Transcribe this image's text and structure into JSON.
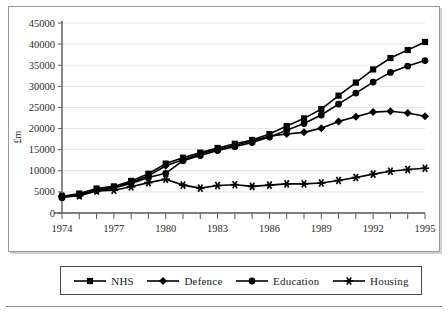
{
  "chart_data": {
    "type": "line",
    "title": "",
    "subtitle": "",
    "xlabel": "",
    "ylabel": "£m",
    "x": [
      1974,
      1975,
      1976,
      1977,
      1978,
      1979,
      1980,
      1981,
      1982,
      1983,
      1984,
      1985,
      1986,
      1987,
      1988,
      1989,
      1990,
      1991,
      1992,
      1993,
      1994,
      1995
    ],
    "xlim": [
      1974,
      1995
    ],
    "ylim": [
      0,
      45000
    ],
    "ytick_labels": [
      "0",
      "5000",
      "10000",
      "15000",
      "20000",
      "25000",
      "30000",
      "35000",
      "40000",
      "45000"
    ],
    "ytick_values": [
      0,
      5000,
      10000,
      15000,
      20000,
      25000,
      30000,
      35000,
      40000,
      45000
    ],
    "xtick_labels": [
      "1974",
      "1977",
      "1980",
      "1983",
      "1986",
      "1989",
      "1992",
      "1995"
    ],
    "xtick_values": [
      1974,
      1977,
      1980,
      1983,
      1986,
      1989,
      1992,
      1995
    ],
    "grid": true,
    "grid_axis": "y",
    "legend_position": "bottom",
    "series": [
      {
        "name": "NHS",
        "marker": "square",
        "color": "#000000",
        "values": [
          3900,
          4600,
          5800,
          6300,
          7600,
          9300,
          11700,
          13100,
          14300,
          15400,
          16400,
          17300,
          18700,
          20600,
          22400,
          24600,
          27800,
          30900,
          34000,
          36700,
          38600,
          40500
        ]
      },
      {
        "name": "Defence",
        "marker": "diamond",
        "color": "#000000",
        "values": [
          3800,
          4400,
          5500,
          6100,
          7200,
          8800,
          11200,
          12600,
          14000,
          15100,
          16000,
          17100,
          18200,
          18700,
          19100,
          20100,
          21700,
          22800,
          23900,
          24100,
          23700,
          22900
        ]
      },
      {
        "name": "Education",
        "marker": "circle",
        "color": "#000000",
        "values": [
          3600,
          4200,
          5300,
          5900,
          7000,
          8400,
          9400,
          12400,
          13600,
          14800,
          15700,
          16700,
          18000,
          19600,
          21200,
          23200,
          25800,
          28400,
          31000,
          33300,
          34800,
          36100
        ]
      },
      {
        "name": "Housing",
        "marker": "star",
        "color": "#000000",
        "values": [
          4000,
          4100,
          5200,
          5400,
          6200,
          7200,
          8000,
          6600,
          5900,
          6500,
          6700,
          6300,
          6600,
          6900,
          6900,
          7100,
          7700,
          8400,
          9200,
          9900,
          10300,
          10600
        ]
      }
    ]
  },
  "legend": {
    "items": [
      {
        "label": "NHS",
        "marker": "square"
      },
      {
        "label": "Defence",
        "marker": "diamond"
      },
      {
        "label": "Education",
        "marker": "circle"
      },
      {
        "label": "Housing",
        "marker": "star"
      }
    ]
  }
}
